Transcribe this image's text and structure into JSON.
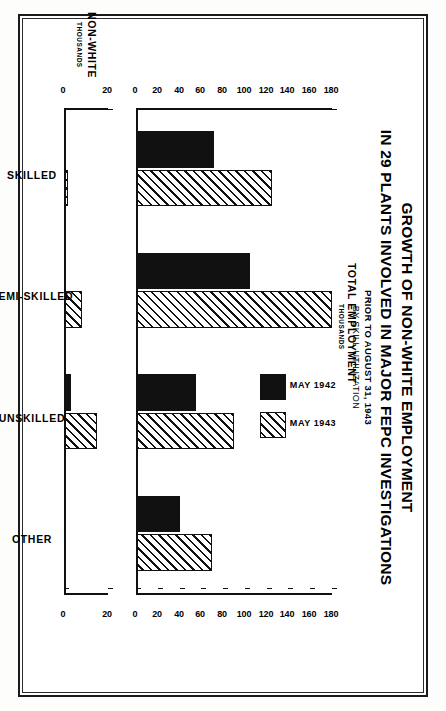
{
  "figure": {
    "title_line1": "GROWTH OF NON-WHITE EMPLOYMENT",
    "title_line2": "IN 29 PLANTS INVOLVED IN MAJOR FEPC INVESTIGATIONS",
    "subtitle_line1": "PRIOR TO AUGUST 31, 1943",
    "subtitle_line2": "BY SKILL UTILIZATION",
    "ink_color": "#111111",
    "paper_color": "#ffffff"
  },
  "legend": {
    "position": "upper-right",
    "entries": [
      {
        "label": "MAY 1942",
        "fill": "solid"
      },
      {
        "label": "MAY 1943",
        "fill": "hatched"
      }
    ]
  },
  "chart_data": [
    {
      "type": "bar",
      "id": "total-employment",
      "title": "TOTAL EMPLOYMENT",
      "ylabel": "TOTAL EMPLOYMENT",
      "ylabel_units": "THOUSANDS",
      "xlabel": "",
      "categories": [
        "SKILLED",
        "SEMI-SKILLED",
        "UNSKILLED",
        "OTHER"
      ],
      "series": [
        {
          "name": "MAY 1942",
          "fill": "solid",
          "values": [
            72,
            105,
            55,
            40
          ]
        },
        {
          "name": "MAY 1943",
          "fill": "hatched",
          "values": [
            125,
            180,
            90,
            70
          ]
        }
      ],
      "ylim": [
        0,
        180
      ],
      "yticks": [
        0,
        20,
        40,
        60,
        80,
        100,
        120,
        140,
        160,
        180
      ],
      "ytick_labels": [
        "0",
        "20",
        "40",
        "60",
        "80",
        "100",
        "120",
        "140",
        "160",
        "180"
      ],
      "grid": false,
      "dual_axis": true
    },
    {
      "type": "bar",
      "id": "non-white-employment",
      "title": "NON-WHITE",
      "ylabel": "NON-WHITE",
      "ylabel_units": "THOUSANDS",
      "xlabel": "",
      "categories": [
        "SKILLED",
        "SEMI-SKILLED",
        "UNSKILLED",
        "OTHER"
      ],
      "series": [
        {
          "name": "MAY 1942",
          "fill": "solid",
          "values": [
            0.2,
            1.0,
            3.0,
            0.4
          ]
        },
        {
          "name": "MAY 1943",
          "fill": "hatched",
          "values": [
            2.0,
            8.0,
            15.0,
            1.0
          ]
        }
      ],
      "ylim": [
        0,
        20
      ],
      "yticks": [
        0,
        20
      ],
      "ytick_labels": [
        "0",
        "20"
      ],
      "grid": false,
      "dual_axis": true
    }
  ]
}
